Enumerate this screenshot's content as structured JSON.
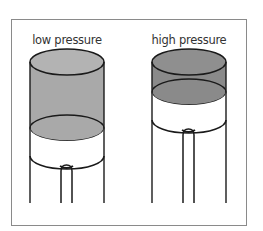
{
  "diagram": {
    "panels": [
      {
        "label": "low pressure",
        "liquid_color": "#a9a9a9",
        "top_color": "#b3b3b3"
      },
      {
        "label": "high pressure",
        "liquid_color": "#8a8a8a",
        "top_color": "#8f8f8f"
      }
    ],
    "colors": {
      "outline": "#1a1a1a",
      "frame": "#8a8a8a",
      "background": "#ffffff"
    }
  }
}
